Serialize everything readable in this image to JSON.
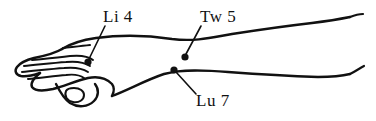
{
  "figure": {
    "description": "Line drawing of a left hand and forearm seen from the radial/dorsal side, fingers pointing left, thumb folded below. Three acupuncture points are marked with filled dots and labeled with leader lines.",
    "background_color": "#ffffff",
    "ink_color": "#111111",
    "view": "dorsal-radial view, palm down"
  },
  "points": [
    {
      "id": "li4",
      "label": "Li 4",
      "meridian": "Large Intestine",
      "number": "4",
      "dot": {
        "x": 88,
        "y": 62
      },
      "leader": {
        "x1": 105,
        "y1": 26,
        "x2": 89,
        "y2": 59
      },
      "label_position": {
        "x": 103,
        "y": 8
      }
    },
    {
      "id": "tw5",
      "label": "Tw 5",
      "meridian": "Triple Warmer",
      "number": "5",
      "dot": {
        "x": 185,
        "y": 57
      },
      "leader": {
        "x1": 201,
        "y1": 26,
        "x2": 186,
        "y2": 54
      },
      "label_position": {
        "x": 200,
        "y": 8
      }
    },
    {
      "id": "lu7",
      "label": "Lu 7",
      "meridian": "Lung",
      "number": "7",
      "dot": {
        "x": 174,
        "y": 70
      },
      "leader": {
        "x1": 176,
        "y1": 72,
        "x2": 196,
        "y2": 94
      },
      "label_position": {
        "x": 196,
        "y": 92
      }
    }
  ]
}
